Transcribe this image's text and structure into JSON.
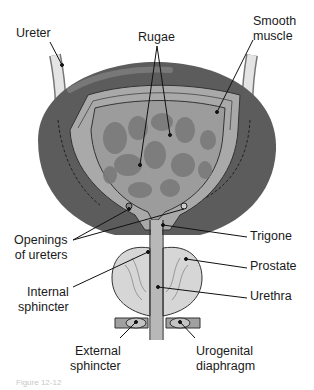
{
  "labels": {
    "ureter": "Ureter",
    "rugae": "Rugae",
    "smooth_muscle": "Smooth\nmuscle",
    "openings_of_ureters": "Openings\nof ureters",
    "trigone": "Trigone",
    "prostate": "Prostate",
    "internal_sphincter": "Internal\nsphincter",
    "urethra": "Urethra",
    "external_sphincter": "External\nsphincter",
    "urogenital_diaphragm": "Urogenital\ndiaphragm"
  },
  "caption": "Figure 12-12",
  "colors": {
    "outer_wall": "#5a5a5a",
    "muscle_layer": "#a8a8a8",
    "lumen": "#9a9a9a",
    "rugae_folds": "#7c7c7c",
    "prostate": "#d8d8d8",
    "ureter_tube": "#e0e0e0",
    "leader_line": "#111111"
  }
}
